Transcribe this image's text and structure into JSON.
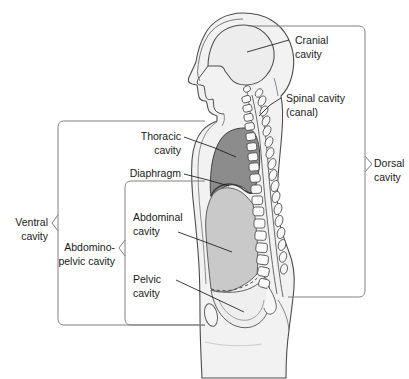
{
  "labels": {
    "cranial_cavity_line1": "Cranial",
    "cranial_cavity_line2": "cavity",
    "spinal_cavity_line1": "Spinal cavity",
    "spinal_cavity_line2": "(canal)",
    "dorsal_cavity_line1": "Dorsal",
    "dorsal_cavity_line2": "cavity",
    "thoracic_cavity_line1": "Thoracic",
    "thoracic_cavity_line2": "cavity",
    "diaphragm": "Diaphragm",
    "abdominal_cavity_line1": "Abdominal",
    "abdominal_cavity_line2": "cavity",
    "pelvic_cavity_line1": "Pelvic",
    "pelvic_cavity_line2": "cavity",
    "ventral_cavity_line1": "Ventral",
    "ventral_cavity_line2": "cavity",
    "abdominopelvic_cavity_line1": "Abdomino-",
    "abdominopelvic_cavity_line2": "pelvic cavity"
  },
  "colors": {
    "body_fill": "#f2f2f2",
    "body_outline": "#4d4d4d",
    "thoracic_fill": "#8c8c8c",
    "abdominal_fill": "#c9c9c9",
    "pelvic_fill": "#efefef",
    "cranial_fill": "#ededed",
    "vertebra_fill": "#fafafa",
    "bracket_stroke": "#808080",
    "leader_stroke": "#1a1a1a",
    "text": "#1a1a1a",
    "background": "#ffffff"
  },
  "brackets": [
    {
      "name": "ventral-cavity-bracket",
      "label": "Ventral cavity"
    },
    {
      "name": "abdominopelvic-cavity-bracket",
      "label": "Abdomino-pelvic cavity"
    },
    {
      "name": "dorsal-cavity-bracket",
      "label": "Dorsal cavity"
    }
  ],
  "regions": [
    {
      "name": "cranial-cavity-region",
      "label": "Cranial cavity"
    },
    {
      "name": "spinal-cavity-region",
      "label": "Spinal cavity (canal)"
    },
    {
      "name": "thoracic-cavity-region",
      "label": "Thoracic cavity"
    },
    {
      "name": "diaphragm-region",
      "label": "Diaphragm"
    },
    {
      "name": "abdominal-cavity-region",
      "label": "Abdominal cavity"
    },
    {
      "name": "pelvic-cavity-region",
      "label": "Pelvic cavity"
    }
  ]
}
